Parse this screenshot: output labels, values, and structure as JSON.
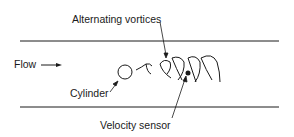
{
  "labels": {
    "vortices": "Alternating vortices",
    "flow": "Flow",
    "cylinder": "Cylinder",
    "sensor": "Velocity sensor"
  },
  "colors": {
    "line": "#1a1a1a",
    "background": "#ffffff"
  }
}
